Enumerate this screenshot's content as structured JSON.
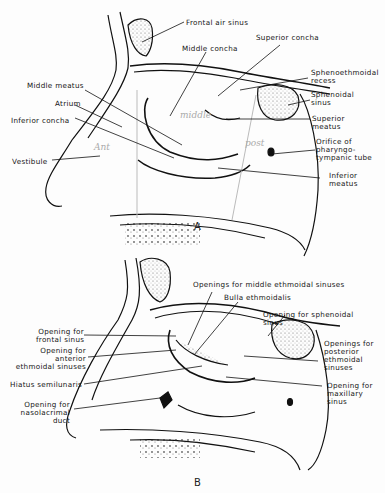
{
  "figure": {
    "panels": [
      {
        "letter": "A",
        "labels": {
          "frontal_air_sinus": "Frontal air sinus",
          "middle_concha": "Middle concha",
          "superior_concha": "Superior concha",
          "sphenoethmoidal_recess_1": "Sphenoethmoidal",
          "sphenoethmoidal_recess_2": "recess",
          "sphenoidal_sinus_1": "Sphenoidal",
          "sphenoidal_sinus_2": "sinus",
          "superior_meatus_1": "Superior",
          "superior_meatus_2": "meatus",
          "orifice_1": "Orifice of",
          "orifice_2": "pharyngo-",
          "orifice_3": "tympanic tube",
          "inferior_meatus_1": "Inferior",
          "inferior_meatus_2": "meatus",
          "middle_meatus": "Middle meatus",
          "atrium": "Atrium",
          "inferior_concha": "Inferior concha",
          "vestibule": "Vestibule"
        },
        "handwritten": {
          "middle": "middle",
          "ant": "Ant",
          "post": "post"
        }
      },
      {
        "letter": "B",
        "labels": {
          "middle_ethmoidal": "Openings for middle ethmoidal sinuses",
          "bulla": "Bulla ethmoidalis",
          "sphenoidal_1": "Opening for sphenoidal",
          "sphenoidal_2": "sinus",
          "frontal_1": "Opening for",
          "frontal_2": "frontal sinus",
          "anterior_1": "Opening for",
          "anterior_2": "anterior",
          "anterior_3": "ethmoidal sinuses",
          "posterior_1": "Openings for",
          "posterior_2": "posterior",
          "posterior_3": "ethmoidal",
          "posterior_4": "sinuses",
          "hiatus": "Hiatus semilunaris",
          "maxillary_1": "Opening for",
          "maxillary_2": "maxillary",
          "maxillary_3": "sinus",
          "nasolacrimal_1": "Opening for",
          "nasolacrimal_2": "nasolacrimal",
          "nasolacrimal_3": "duct"
        }
      }
    ]
  }
}
